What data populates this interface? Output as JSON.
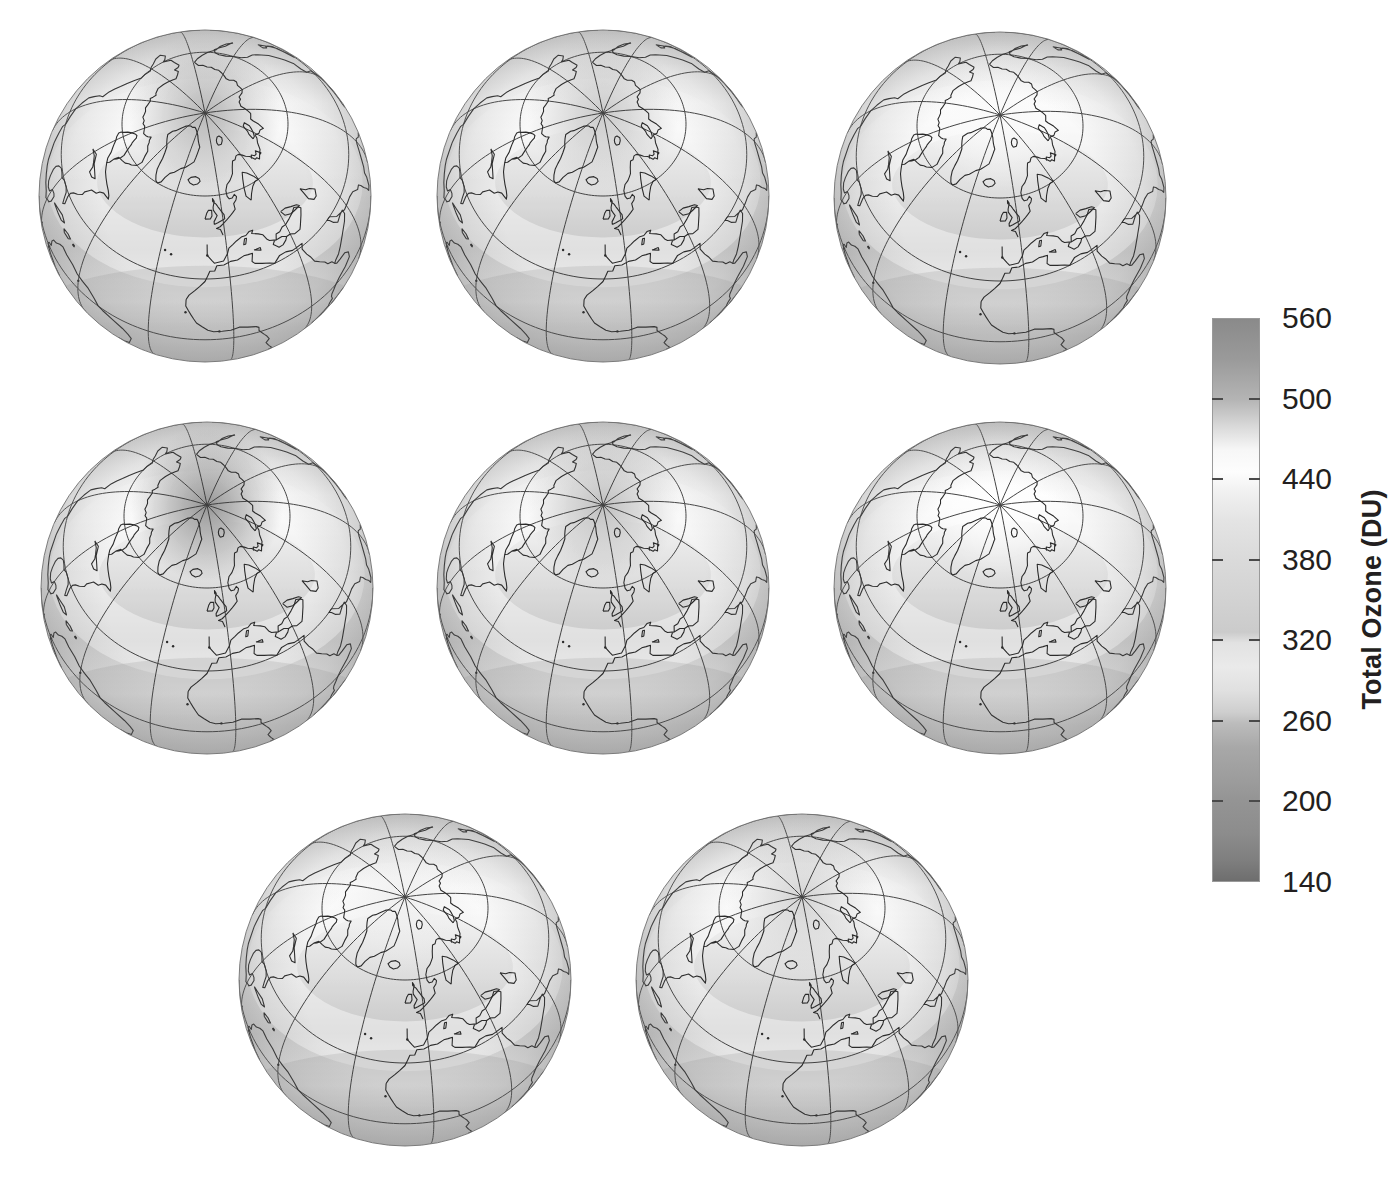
{
  "figure": {
    "kind": "multi-panel-globe-map",
    "background_color": "#ffffff",
    "panel_rows": [
      3,
      3,
      2
    ],
    "panel_count": 8
  },
  "colorbar": {
    "title": "Total Ozone (DU)",
    "unit": "DU",
    "quantity": "Total Ozone",
    "orientation": "vertical",
    "vmin": 140,
    "vmax": 560,
    "tick_labels": [
      "560",
      "500",
      "440",
      "380",
      "320",
      "260",
      "200",
      "140"
    ],
    "tick_values": [
      560,
      500,
      440,
      380,
      320,
      260,
      200,
      140
    ],
    "tick_step": 60,
    "colormap": "grayscale-rainbow",
    "outline_color": "#9a9a9a",
    "tick_color": "#4a4a4a",
    "label_color": "#231f20",
    "stops": [
      {
        "value": 560,
        "color": "#8a8a8a"
      },
      {
        "value": 530,
        "color": "#9a9a9a"
      },
      {
        "value": 500,
        "color": "#b4b4b4"
      },
      {
        "value": 478,
        "color": "#dcdcdc"
      },
      {
        "value": 462,
        "color": "#f7f7f7"
      },
      {
        "value": 446,
        "color": "#fdfdfd"
      },
      {
        "value": 430,
        "color": "#f0f0f0"
      },
      {
        "value": 410,
        "color": "#e4e4e4"
      },
      {
        "value": 380,
        "color": "#dadada"
      },
      {
        "value": 350,
        "color": "#d2d2d2"
      },
      {
        "value": 326,
        "color": "#cbcbcb"
      },
      {
        "value": 318,
        "color": "#e2e2e2"
      },
      {
        "value": 300,
        "color": "#eaeaea"
      },
      {
        "value": 282,
        "color": "#e0e0e0"
      },
      {
        "value": 266,
        "color": "#cecece"
      },
      {
        "value": 258,
        "color": "#bcbcbc"
      },
      {
        "value": 240,
        "color": "#a8a8a8"
      },
      {
        "value": 215,
        "color": "#9c9c9c"
      },
      {
        "value": 200,
        "color": "#949494"
      },
      {
        "value": 175,
        "color": "#8c8c8c"
      },
      {
        "value": 155,
        "color": "#7e7e7e"
      },
      {
        "value": 140,
        "color": "#6e6e6e"
      }
    ]
  },
  "chart_data": {
    "type": "heatmap",
    "title": "",
    "subtitle": "",
    "xlabel": "",
    "ylabel": "",
    "colorbar_label": "Total Ozone (DU)",
    "value_range": [
      140,
      560
    ],
    "legend_position": "right",
    "grid": true,
    "projection": "orthographic",
    "projection_center": {
      "lat": 60,
      "lon": -10
    },
    "graticule": {
      "meridian_spacing_deg": 30,
      "parallel_spacing_deg": 30,
      "extra_parallels_deg": [
        60
      ],
      "line_color": "#3a3a3a"
    },
    "panels": [
      {
        "index": 1,
        "row": 1,
        "col": 1,
        "center_x": 205,
        "center_y": 196,
        "radius": 166,
        "polar_value": 330,
        "midlat_value": 420,
        "tropics_value": 275
      },
      {
        "index": 2,
        "row": 1,
        "col": 2,
        "center_x": 603,
        "center_y": 196,
        "radius": 166,
        "polar_value": 350,
        "midlat_value": 430,
        "tropics_value": 272
      },
      {
        "index": 3,
        "row": 1,
        "col": 3,
        "center_x": 1000,
        "center_y": 198,
        "radius": 166,
        "polar_value": 395,
        "midlat_value": 440,
        "tropics_value": 275
      },
      {
        "index": 4,
        "row": 2,
        "col": 1,
        "center_x": 207,
        "center_y": 588,
        "radius": 166,
        "polar_value": 300,
        "midlat_value": 445,
        "tropics_value": 278
      },
      {
        "index": 5,
        "row": 2,
        "col": 2,
        "center_x": 603,
        "center_y": 588,
        "radius": 166,
        "polar_value": 340,
        "midlat_value": 425,
        "tropics_value": 268
      },
      {
        "index": 6,
        "row": 2,
        "col": 3,
        "center_x": 1000,
        "center_y": 588,
        "radius": 166,
        "polar_value": 400,
        "midlat_value": 438,
        "tropics_value": 272
      },
      {
        "index": 7,
        "row": 3,
        "col": 1,
        "center_x": 405,
        "center_y": 980,
        "radius": 166,
        "polar_value": 385,
        "midlat_value": 442,
        "tropics_value": 276
      },
      {
        "index": 8,
        "row": 3,
        "col": 2,
        "center_x": 802,
        "center_y": 980,
        "radius": 166,
        "polar_value": 360,
        "midlat_value": 430,
        "tropics_value": 270
      }
    ]
  },
  "credit": ""
}
